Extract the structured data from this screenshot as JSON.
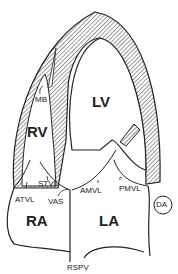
{
  "diagram": {
    "type": "echocardiographic apical four-chamber schematic",
    "chambers": {
      "lv": "LV",
      "rv": "RV",
      "ra": "RA",
      "la": "LA"
    },
    "structures": {
      "mb": "MB",
      "stvl": "STVL",
      "atvl": "ATVL",
      "vas": "VAS",
      "amvl": "AMVL",
      "pmvl": "PMVL",
      "da": "DA",
      "rspv": "RSPV"
    },
    "colors": {
      "line": "#222222",
      "background": "#ffffff"
    }
  }
}
